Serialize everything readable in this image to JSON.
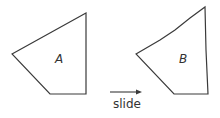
{
  "diagram": {
    "shapes": [
      {
        "id": "A",
        "label": "A",
        "points": "12,54 86,13 86,94 50,94",
        "label_pos": [
          55,
          52
        ]
      },
      {
        "id": "B",
        "label": "B",
        "points": "136,54 160,40 175,30 190,18 205,7 206,50 208,94 174,94",
        "label_pos": [
          179,
          52
        ]
      }
    ],
    "arrow": {
      "from": [
        110,
        92
      ],
      "to": [
        141,
        92
      ],
      "caption": "slide"
    },
    "stroke_color": "#3a3a3a"
  }
}
